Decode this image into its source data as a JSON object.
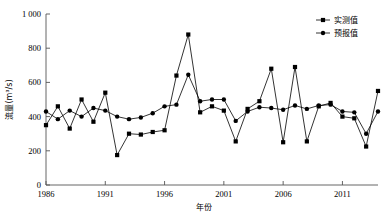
{
  "chart_data": {
    "type": "line",
    "title": "",
    "xlabel": "年份",
    "ylabel": "流量(m³/s)",
    "xlim": [
      1986,
      2014
    ],
    "ylim": [
      0,
      1000
    ],
    "xticks": [
      1986,
      1991,
      1996,
      2001,
      2006,
      2011
    ],
    "yticks": [
      0,
      200,
      400,
      600,
      800,
      1000
    ],
    "ytick_labels": [
      "0",
      "200",
      "400",
      "600",
      "800",
      "1 000"
    ],
    "xtick_labels": [
      "1986",
      "1991",
      "1996",
      "2001",
      "2006",
      "2011"
    ],
    "grid": false,
    "legend_position": "top-right",
    "x": [
      1986,
      1987,
      1988,
      1989,
      1990,
      1991,
      1992,
      1993,
      1994,
      1995,
      1996,
      1997,
      1998,
      1999,
      2000,
      2001,
      2002,
      2003,
      2004,
      2005,
      2006,
      2007,
      2008,
      2009,
      2010,
      2011,
      2012,
      2013,
      2014
    ],
    "series": [
      {
        "name": "实测值",
        "marker": "square",
        "values": [
          350,
          460,
          330,
          500,
          370,
          540,
          175,
          300,
          295,
          310,
          320,
          640,
          880,
          425,
          460,
          435,
          255,
          445,
          490,
          680,
          250,
          690,
          255,
          460,
          480,
          400,
          390,
          225,
          550
        ]
      },
      {
        "name": "预报值",
        "marker": "circle",
        "values": [
          430,
          385,
          435,
          400,
          450,
          435,
          400,
          385,
          395,
          420,
          460,
          470,
          645,
          490,
          500,
          500,
          375,
          430,
          455,
          450,
          440,
          465,
          445,
          465,
          470,
          430,
          425,
          300,
          430
        ]
      }
    ]
  },
  "legend": {
    "items": [
      {
        "label": "实测值",
        "marker": "square"
      },
      {
        "label": "预报值",
        "marker": "circle"
      }
    ]
  },
  "axes": {
    "y_axis_label": "流量(m³/s)",
    "x_axis_label": "年份"
  },
  "ghost_header": ""
}
